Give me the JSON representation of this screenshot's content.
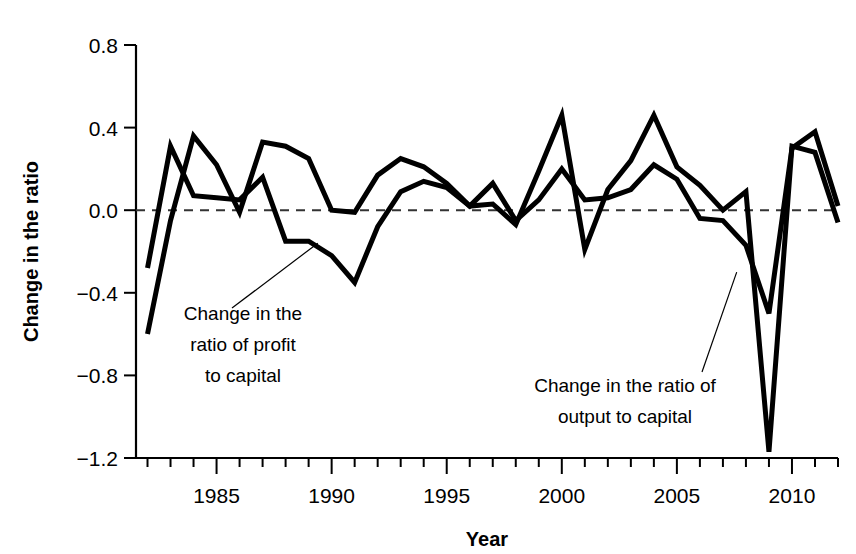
{
  "chart_data": {
    "type": "line",
    "title": "",
    "xlabel": "Year",
    "ylabel": "Change in the ratio",
    "xlim": [
      1981.5,
      2012
    ],
    "ylim": [
      -1.2,
      0.8
    ],
    "grid": false,
    "legend_position": "inline-annotations",
    "x_major_ticks": [
      1985,
      1990,
      1995,
      2000,
      2005,
      2010
    ],
    "x_major_tick_labels": [
      "1985",
      "1990",
      "1995",
      "2000",
      "2005",
      "2010"
    ],
    "x_minor_tick_step": 1,
    "y_ticks": [
      -1.2,
      -0.8,
      -0.4,
      0.0,
      0.4,
      0.8
    ],
    "y_tick_labels": [
      "−1.2",
      "−0.8",
      "−0.4",
      "0.0",
      "0.4",
      "0.8"
    ],
    "zero_reference_line": 0.0,
    "x": [
      1982,
      1983,
      1984,
      1985,
      1986,
      1987,
      1988,
      1989,
      1990,
      1991,
      1992,
      1993,
      1994,
      1995,
      1996,
      1997,
      1998,
      1999,
      2000,
      2001,
      2002,
      2003,
      2004,
      2005,
      2006,
      2007,
      2008,
      2009,
      2010,
      2011,
      2012
    ],
    "series": [
      {
        "name": "Change in the ratio of profit to capital",
        "values": [
          -0.28,
          0.31,
          0.07,
          0.06,
          0.05,
          0.16,
          -0.15,
          -0.15,
          -0.22,
          -0.35,
          -0.08,
          0.09,
          0.14,
          0.11,
          0.02,
          0.13,
          -0.05,
          0.05,
          0.2,
          0.05,
          0.06,
          0.1,
          0.22,
          0.15,
          -0.04,
          -0.05,
          -0.17,
          -0.5,
          0.3,
          0.38,
          0.02
        ]
      },
      {
        "name": "Change in the ratio of output to capital",
        "values": [
          -0.6,
          -0.05,
          0.36,
          0.22,
          -0.01,
          0.33,
          0.31,
          0.25,
          0.0,
          -0.01,
          0.17,
          0.25,
          0.21,
          0.13,
          0.02,
          0.03,
          -0.07,
          0.19,
          0.46,
          -0.19,
          0.1,
          0.24,
          0.46,
          0.21,
          0.12,
          0.0,
          0.09,
          -1.17,
          0.31,
          0.28,
          -0.06
        ]
      }
    ],
    "annotations": [
      {
        "text_lines": [
          "Change in the",
          "ratio of profit",
          "to capital"
        ],
        "anchor_year": 1989.4,
        "anchor_value": -0.16
      },
      {
        "text_lines": [
          "Change in the ratio of",
          "output to capital"
        ],
        "anchor_year": 2007.6,
        "anchor_value": -0.3
      }
    ]
  }
}
